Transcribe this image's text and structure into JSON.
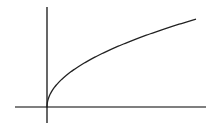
{
  "chart_data": {
    "type": "line",
    "title": "",
    "xlabel": "",
    "ylabel": "",
    "grid": false,
    "legend": null,
    "function": "y = sqrt(x)",
    "series": [
      {
        "name": "sqrt curve",
        "x": [
          0,
          1,
          4,
          9,
          16,
          25,
          36,
          49,
          64,
          81,
          100,
          121,
          144,
          149
        ],
        "values": [
          0,
          1,
          2,
          3,
          4,
          5,
          6,
          7,
          8,
          9,
          10,
          11,
          12,
          12.2
        ]
      }
    ],
    "colors": {
      "axes": "#000000",
      "curve": "#222222",
      "background": "#ffffff"
    }
  },
  "layout": {
    "origin_px": [
      47,
      107
    ],
    "x_axis_px": [
      15,
      206
    ],
    "y_axis_px": [
      7,
      123
    ],
    "scale_px": [
      1,
      7.2
    ]
  }
}
